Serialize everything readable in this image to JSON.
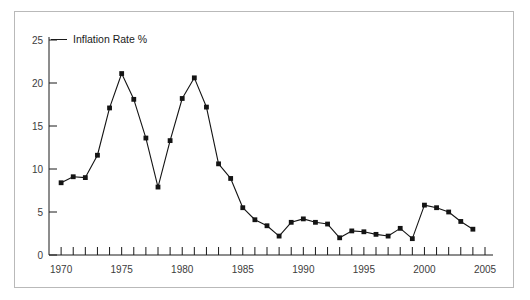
{
  "figure": {
    "border_color": "#b9b9b9",
    "background": "#ffffff"
  },
  "chart_data": {
    "type": "line",
    "title": "Inflation Rate %",
    "xlabel": "",
    "ylabel": "",
    "xlim": [
      1969,
      2005
    ],
    "ylim": [
      0,
      25
    ],
    "grid": false,
    "legend": null,
    "line_color": "#141414",
    "marker": "square",
    "y_ticks": [
      0,
      5,
      10,
      15,
      20,
      25
    ],
    "y_tick_labels": [
      "0",
      "5",
      "10",
      "15",
      "20",
      "25"
    ],
    "x_ticks": [
      1970,
      1971,
      1972,
      1973,
      1974,
      1975,
      1976,
      1977,
      1978,
      1979,
      1980,
      1981,
      1982,
      1983,
      1984,
      1985,
      1986,
      1987,
      1988,
      1989,
      1990,
      1991,
      1992,
      1993,
      1994,
      1995,
      1996,
      1997,
      1998,
      1999,
      2000,
      2001,
      2002,
      2003,
      2004,
      2005
    ],
    "x_tick_labels": [
      "1970",
      "1975",
      "1980",
      "1985",
      "1990",
      "1995",
      "2000",
      "2005"
    ],
    "x_labeled_ticks": [
      1970,
      1975,
      1980,
      1985,
      1990,
      1995,
      2000,
      2005
    ],
    "x": [
      1970,
      1971,
      1972,
      1973,
      1974,
      1975,
      1976,
      1977,
      1978,
      1979,
      1980,
      1981,
      1982,
      1983,
      1984,
      1985,
      1986,
      1987,
      1988,
      1989,
      1990,
      1991,
      1992,
      1993,
      1994,
      1995,
      1996,
      1997,
      1998,
      1999,
      2000,
      2001,
      2002,
      2003,
      2004
    ],
    "values": [
      8.4,
      9.1,
      9.0,
      11.6,
      17.1,
      21.1,
      18.1,
      13.6,
      7.9,
      13.3,
      18.2,
      20.6,
      17.2,
      10.6,
      8.9,
      5.5,
      4.1,
      3.4,
      2.2,
      3.8,
      4.2,
      3.8,
      3.6,
      2.0,
      2.8,
      2.7,
      2.4,
      2.2,
      3.1,
      1.9,
      5.8,
      5.5,
      5.0,
      3.9,
      3.0
    ]
  }
}
